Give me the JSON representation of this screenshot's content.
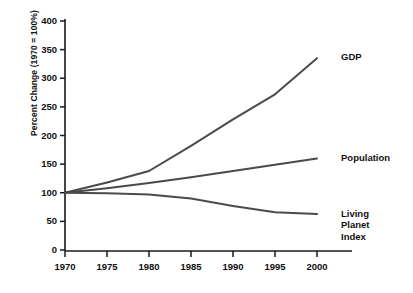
{
  "chart_data": {
    "type": "line",
    "title": "",
    "subtitle": "",
    "xlabel": "",
    "ylabel": "Percent Change (1970 = 100%)",
    "x": [
      1970,
      1975,
      1980,
      1985,
      1990,
      1995,
      2000
    ],
    "xlim": [
      1968,
      2001
    ],
    "ylim": [
      0,
      400
    ],
    "ytick_labels": [
      "400",
      "350",
      "300",
      "250",
      "200",
      "150",
      "100",
      "50",
      "0"
    ],
    "ytick_values": [
      400,
      350,
      300,
      250,
      200,
      150,
      100,
      50,
      0
    ],
    "xtick_labels": [
      "1970",
      "1975",
      "1980",
      "1985",
      "1990",
      "1995",
      "2000"
    ],
    "grid": false,
    "legend_position": "right-inline-labels",
    "line_color": "#4a4a4a",
    "axis_color": "#1a1a1a",
    "series": [
      {
        "name": "GDP",
        "label": "GDP",
        "values": [
          100,
          118,
          138,
          182,
          228,
          272,
          335
        ]
      },
      {
        "name": "Population",
        "label": "Population",
        "values": [
          100,
          108,
          117,
          127,
          138,
          149,
          160
        ]
      },
      {
        "name": "Living Planet Index",
        "label": "Living Planet Index",
        "label_lines": [
          "Living",
          "Planet",
          "Index"
        ],
        "values": [
          100,
          99,
          97,
          90,
          77,
          66,
          63
        ]
      }
    ]
  },
  "labels": {
    "gdp": "GDP",
    "population": "Population",
    "lpi_line1": "Living",
    "lpi_line2": "Planet",
    "lpi_line3": "Index"
  },
  "axis": {
    "y_title": "Percent Change (1970 = 100%)",
    "y_ticks": [
      "400",
      "350",
      "300",
      "250",
      "200",
      "150",
      "100",
      "50",
      "0"
    ],
    "x_ticks": [
      "1970",
      "1975",
      "1980",
      "1985",
      "1990",
      "1995",
      "2000"
    ]
  }
}
